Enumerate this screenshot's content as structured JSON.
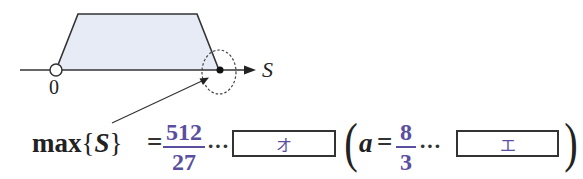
{
  "diagram": {
    "axis_label": "S",
    "origin_label": "0",
    "region_fill": "#e6ebf5",
    "line_color": "#333333",
    "note": "Trapezoid region above S-axis; right end point highlighted by dashed ellipse and pointer arrow"
  },
  "formula": {
    "max_func": "max",
    "brace_open": "{",
    "variable": "S",
    "brace_close": "}",
    "equals": "=",
    "max_value": {
      "numerator": "512",
      "denominator": "27"
    },
    "dots_1": "···",
    "answer_box_1": {
      "label": "オ"
    },
    "paren_open": "(",
    "param_variable": "a",
    "equals_2": "=",
    "param_value": {
      "numerator": "8",
      "denominator": "3"
    },
    "dots_2": "···",
    "answer_box_2": {
      "label": "エ"
    },
    "paren_close": ")"
  },
  "colors": {
    "accent": "#5a4e9e",
    "text": "#222222",
    "fill": "#e6ebf5"
  }
}
